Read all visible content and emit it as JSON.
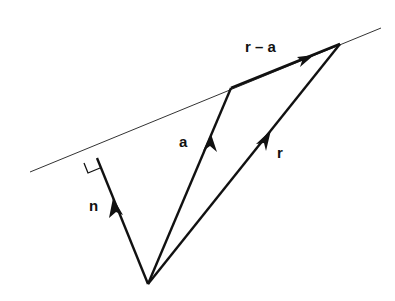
{
  "diagram": {
    "colors": {
      "ink": "#111111",
      "background": "#ffffff"
    },
    "labels": {
      "r_minus_a": "r – a",
      "a": "a",
      "r": "r",
      "n": "n"
    },
    "elements": [
      {
        "id": "plane-line",
        "kind": "line",
        "description": "plane (line) containing tips of a and r"
      },
      {
        "id": "vector-n",
        "kind": "arrow",
        "label": "n",
        "description": "normal vector from origin, perpendicular to plane"
      },
      {
        "id": "vector-a",
        "kind": "arrow",
        "label": "a",
        "description": "position vector of known point on plane"
      },
      {
        "id": "vector-r",
        "kind": "arrow",
        "label": "r",
        "description": "position vector of general point on plane"
      },
      {
        "id": "vector-r-minus-a",
        "kind": "arrow",
        "label": "r – a",
        "description": "vector lying in the plane from tip of a to tip of r"
      },
      {
        "id": "right-angle",
        "kind": "marker",
        "description": "right angle between n and plane"
      }
    ]
  }
}
